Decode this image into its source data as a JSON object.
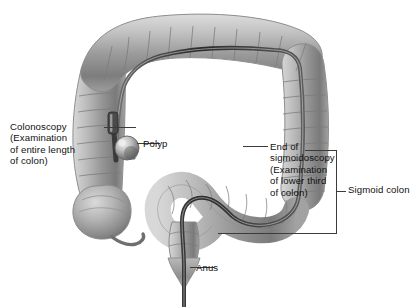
{
  "figure": {
    "domain_note": "grayscale medical illustration of the large intestine",
    "background_color": "#ffffff",
    "ink_color": "#111111",
    "leader_color": "#3c3c3c",
    "scope_color": "#2b2b2b",
    "colon_fill_light": "#cfcfcf",
    "colon_fill_mid": "#9e9e9e",
    "colon_fill_dark": "#6f6f6f",
    "colon_outline": "#8a8a8a"
  },
  "annotations": {
    "colonoscopy": {
      "line1": "Colonoscopy",
      "line2": "(Examination",
      "line3": "of entire length",
      "line4": "of colon)"
    },
    "polyp": {
      "label": "Polyp"
    },
    "end_sigmoidoscopy": {
      "line1": "End of",
      "line2": "sigmoidoscopy",
      "line3": "(Examination",
      "line4": "of lower third",
      "line5": "of colon)"
    },
    "sigmoid_colon": {
      "label": "Sigmoid colon"
    },
    "anus": {
      "label": "Anus"
    }
  },
  "caption": {
    "text": ""
  }
}
